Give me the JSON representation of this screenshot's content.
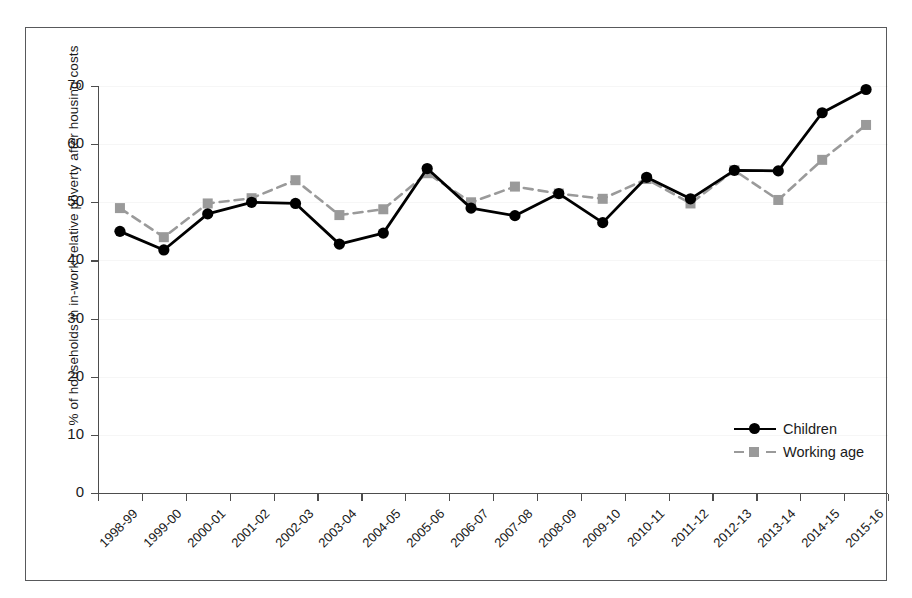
{
  "chart_data": {
    "type": "line",
    "title": "",
    "xlabel": "",
    "ylabel": "% of households in in-work relative poverty after housing costs",
    "ylim": [
      0,
      70
    ],
    "yticks": [
      0,
      10,
      20,
      30,
      40,
      50,
      60,
      70
    ],
    "ytick_labels": [
      "0",
      "10",
      "20",
      "30",
      "40",
      "50",
      "60",
      "70"
    ],
    "grid": false,
    "legend_position": "center-right",
    "categories": [
      "1998-99",
      "1999-00",
      "2000-01",
      "2001-02",
      "2002-03",
      "2003-04",
      "2004-05",
      "2005-06",
      "2006-07",
      "2007-08",
      "2008-09",
      "2009-10",
      "2010-11",
      "2011-12",
      "2012-13",
      "2013-14",
      "2014-15",
      "2015-16"
    ],
    "series": [
      {
        "name": "Children",
        "color": "#000000",
        "marker": "circle",
        "linestyle": "solid",
        "values": [
          45.0,
          41.8,
          48.0,
          50.0,
          49.8,
          42.8,
          44.7,
          55.8,
          49.0,
          47.7,
          51.5,
          46.5,
          54.3,
          50.6,
          55.5,
          55.4,
          65.4,
          69.4
        ]
      },
      {
        "name": "Working age",
        "color": "#9a9a9a",
        "marker": "square",
        "linestyle": "dashed",
        "values": [
          49.0,
          44.0,
          49.8,
          50.7,
          53.8,
          47.8,
          48.8,
          55.0,
          50.0,
          52.7,
          51.5,
          50.6,
          54.0,
          49.8,
          55.5,
          50.4,
          57.3,
          63.3
        ]
      }
    ]
  },
  "legend": {
    "items": [
      {
        "label": "Children"
      },
      {
        "label": "Working age"
      }
    ]
  },
  "colors": {
    "children": "#000000",
    "working_age": "#9a9a9a",
    "axis": "#4d4d4d",
    "frame": "#58595b"
  }
}
